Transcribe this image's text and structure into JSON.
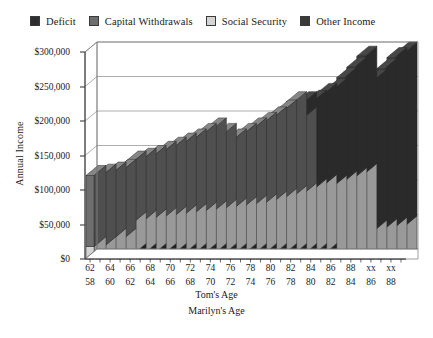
{
  "legend": {
    "items": [
      {
        "label": "Deficit",
        "color": "#2e2e2e",
        "icon": "legend-swatch-icon"
      },
      {
        "label": "Capital Withdrawals",
        "color": "#6e6e6e",
        "icon": "legend-swatch-icon"
      },
      {
        "label": "Social Security",
        "color": "#d4d4d4",
        "icon": "legend-swatch-icon"
      },
      {
        "label": "Other Income",
        "color": "#3a3a3a",
        "icon": "legend-swatch-icon"
      }
    ]
  },
  "axes": {
    "ylabel": "Annual Income",
    "xlabel_primary": "Tom's Age",
    "xlabel_secondary": "Marilyn's Age",
    "yticks": [
      "$0",
      "$50,000",
      "$100,000",
      "$150,000",
      "$200,000",
      "$250,000",
      "$300,000"
    ]
  },
  "chart_data": {
    "type": "bar",
    "title": "",
    "subtitle": "",
    "xlabel": "Tom's Age / Marilyn's Age",
    "ylabel": "Annual Income",
    "ylim": [
      0,
      300000
    ],
    "ytick_values": [
      0,
      50000,
      100000,
      150000,
      200000,
      250000,
      300000
    ],
    "ytick_labels": [
      "$0",
      "$50,000",
      "$100,000",
      "$150,000",
      "$200,000",
      "$250,000",
      "$300,000"
    ],
    "grid": true,
    "grid_axis": "y",
    "legend_position": "top",
    "stacked": true,
    "style": "3d-stacked-bar-grayscale",
    "categories": [
      "62",
      "63",
      "64",
      "65",
      "66",
      "67",
      "68",
      "69",
      "70",
      "71",
      "72",
      "73",
      "74",
      "75",
      "76",
      "77",
      "78",
      "79",
      "80",
      "81",
      "82",
      "83",
      "84",
      "85",
      "86",
      "87",
      "88",
      "89",
      "xx",
      "xx",
      "xx",
      "xx"
    ],
    "toms_age": [
      "62",
      "63",
      "64",
      "65",
      "66",
      "67",
      "68",
      "69",
      "70",
      "71",
      "72",
      "73",
      "74",
      "75",
      "76",
      "77",
      "78",
      "79",
      "80",
      "81",
      "82",
      "83",
      "84",
      "85",
      "86",
      "87",
      "88",
      "89",
      "xx",
      "xx",
      "xx",
      "xx"
    ],
    "marilyns_age": [
      "58",
      "59",
      "60",
      "61",
      "62",
      "63",
      "64",
      "65",
      "66",
      "67",
      "68",
      "69",
      "70",
      "71",
      "72",
      "73",
      "74",
      "75",
      "76",
      "77",
      "78",
      "79",
      "80",
      "81",
      "82",
      "83",
      "84",
      "85",
      "86",
      "87",
      "88",
      "89"
    ],
    "toms_age_ticks_shown": [
      "62",
      "64",
      "66",
      "68",
      "70",
      "72",
      "74",
      "76",
      "78",
      "80",
      "82",
      "84",
      "86",
      "88",
      "xx",
      "xx"
    ],
    "marilyns_age_ticks_shown": [
      "58",
      "60",
      "62",
      "64",
      "66",
      "68",
      "70",
      "72",
      "74",
      "76",
      "78",
      "80",
      "82",
      "84",
      "86",
      "88"
    ],
    "series": [
      {
        "name": "Deficit",
        "color": "#2e2e2e",
        "values": [
          0,
          0,
          0,
          0,
          8000,
          8000,
          8000,
          8000,
          8000,
          8000,
          8000,
          8000,
          8000,
          8000,
          8000,
          8000,
          8000,
          8000,
          8000,
          8000,
          8000,
          8000,
          8000,
          8000,
          0,
          0,
          0,
          0,
          0,
          0,
          0,
          0
        ]
      },
      {
        "name": "Social Security",
        "color": "#d4d4d4",
        "values": [
          18000,
          18000,
          30000,
          30000,
          46000,
          48000,
          50000,
          52000,
          54000,
          56000,
          58000,
          60000,
          62000,
          64000,
          66000,
          68000,
          70000,
          72000,
          76000,
          80000,
          84000,
          88000,
          94000,
          100000,
          107000,
          113000,
          118000,
          124000,
          42000,
          44000,
          46000,
          48000
        ]
      },
      {
        "name": "Capital Withdrawals",
        "color": "#6e6e6e",
        "values": [
          103000,
          105000,
          96000,
          100000,
          88000,
          90000,
          92000,
          96000,
          100000,
          104000,
          108000,
          114000,
          120000,
          110000,
          100000,
          106000,
          112000,
          118000,
          122000,
          128000,
          136000,
          110000,
          0,
          0,
          0,
          0,
          0,
          0,
          0,
          0,
          0,
          0
        ]
      },
      {
        "name": "Other Income",
        "color": "#3a3a3a",
        "values": [
          0,
          0,
          0,
          0,
          0,
          0,
          0,
          0,
          0,
          0,
          0,
          0,
          0,
          0,
          0,
          0,
          0,
          0,
          0,
          0,
          0,
          22000,
          128000,
          132000,
          140000,
          150000,
          160000,
          170000,
          218000,
          232000,
          246000,
          252000
        ]
      }
    ],
    "totals": [
      121000,
      123000,
      126000,
      130000,
      142000,
      146000,
      150000,
      156000,
      162000,
      168000,
      174000,
      182000,
      190000,
      182000,
      174000,
      182000,
      190000,
      198000,
      206000,
      216000,
      228000,
      228000,
      230000,
      240000,
      247000,
      263000,
      278000,
      294000,
      260000,
      276000,
      292000,
      300000
    ]
  }
}
